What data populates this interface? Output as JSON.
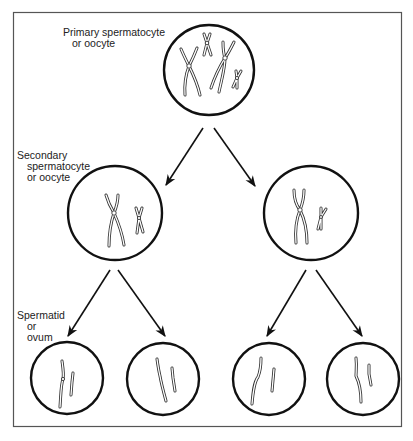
{
  "diagram": {
    "type": "meiosis-flowchart",
    "stages": [
      {
        "id": "primary",
        "label_lines": [
          "Primary spermatocyte",
          "or oocyte"
        ],
        "cell_count": 1,
        "chromosome_description": "two homologous pairs of duplicated chromosomes (4 X-shaped chromosomes)"
      },
      {
        "id": "secondary",
        "label_lines": [
          "Secondary",
          "spermatocyte",
          "or oocyte"
        ],
        "cell_count": 2,
        "chromosome_description": "one duplicated chromosome from each pair (2 X-shaped chromosomes)"
      },
      {
        "id": "spermatid",
        "label_lines": [
          "Spermatid",
          "or",
          "ovum"
        ],
        "cell_count": 4,
        "chromosome_description": "single chromatids (2 per cell)"
      }
    ],
    "arrows": [
      {
        "from": "primary",
        "to": "secondary-left"
      },
      {
        "from": "primary",
        "to": "secondary-right"
      },
      {
        "from": "secondary-left",
        "to": "spermatid-1"
      },
      {
        "from": "secondary-left",
        "to": "spermatid-2"
      },
      {
        "from": "secondary-right",
        "to": "spermatid-3"
      },
      {
        "from": "secondary-right",
        "to": "spermatid-4"
      }
    ],
    "colors": {
      "line": "#111111",
      "frame": "#555555",
      "background": "#ffffff"
    }
  }
}
